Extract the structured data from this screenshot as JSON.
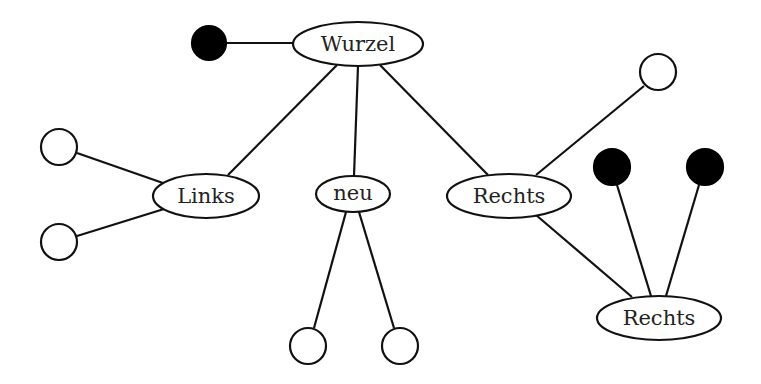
{
  "diagram": {
    "type": "tree",
    "colors": {
      "line": "#111111",
      "filled_leaf": "#000000",
      "empty_leaf": "#ffffff",
      "background": "#ffffff"
    },
    "nodes": {
      "root": {
        "label": "Wurzel"
      },
      "left": {
        "label": "Links"
      },
      "new": {
        "label": "neu"
      },
      "right": {
        "label": "Rechts"
      },
      "right_child": {
        "label": "Rechts"
      }
    },
    "leaves": [
      {
        "id": "root-leaf",
        "filled": true,
        "parent": "Wurzel"
      },
      {
        "id": "left-leaf-1",
        "filled": false,
        "parent": "Links"
      },
      {
        "id": "left-leaf-2",
        "filled": false,
        "parent": "Links"
      },
      {
        "id": "new-leaf-1",
        "filled": false,
        "parent": "neu"
      },
      {
        "id": "new-leaf-2",
        "filled": false,
        "parent": "neu"
      },
      {
        "id": "right-leaf",
        "filled": false,
        "parent": "Rechts"
      },
      {
        "id": "right-child-leaf-1",
        "filled": true,
        "parent": "Rechts (child)"
      },
      {
        "id": "right-child-leaf-2",
        "filled": true,
        "parent": "Rechts (child)"
      }
    ],
    "edges": [
      [
        "Wurzel",
        "root-leaf"
      ],
      [
        "Wurzel",
        "Links"
      ],
      [
        "Wurzel",
        "neu"
      ],
      [
        "Wurzel",
        "Rechts"
      ],
      [
        "Links",
        "left-leaf-1"
      ],
      [
        "Links",
        "left-leaf-2"
      ],
      [
        "neu",
        "new-leaf-1"
      ],
      [
        "neu",
        "new-leaf-2"
      ],
      [
        "Rechts",
        "right-leaf"
      ],
      [
        "Rechts",
        "Rechts (child)"
      ],
      [
        "Rechts (child)",
        "right-child-leaf-1"
      ],
      [
        "Rechts (child)",
        "right-child-leaf-2"
      ]
    ]
  }
}
